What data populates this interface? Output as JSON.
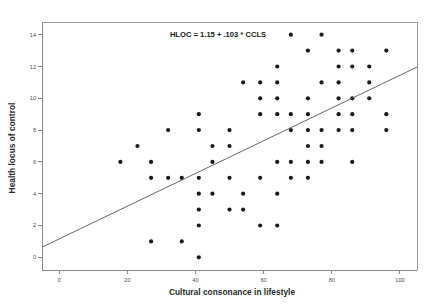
{
  "chart_data": {
    "type": "scatter",
    "title": "",
    "annotation": "HLOC = 1.15 + .103 * CCLS",
    "xlabel": "Cultural consonance in lifestyle",
    "ylabel": "Health locus of control",
    "xlim": [
      -5,
      105
    ],
    "ylim": [
      -0.8,
      14.8
    ],
    "xticks": [
      0,
      20,
      40,
      60,
      80,
      100
    ],
    "yticks": [
      0,
      2,
      4,
      6,
      8,
      10,
      12,
      14
    ],
    "grid": false,
    "legend": "none",
    "point_color": "#1a1a1a",
    "line_color": "#555555",
    "fit": {
      "intercept": 1.15,
      "slope": 0.103,
      "x_start": -5,
      "x_end": 105
    },
    "points": [
      [
        18,
        6
      ],
      [
        23,
        7
      ],
      [
        27,
        6
      ],
      [
        27,
        5
      ],
      [
        27,
        1
      ],
      [
        32,
        8
      ],
      [
        32,
        5
      ],
      [
        36,
        5
      ],
      [
        36,
        1
      ],
      [
        41,
        9
      ],
      [
        41,
        8
      ],
      [
        41,
        5
      ],
      [
        41,
        4
      ],
      [
        41,
        3
      ],
      [
        41,
        2
      ],
      [
        41,
        0
      ],
      [
        45,
        7
      ],
      [
        45,
        6
      ],
      [
        45,
        4
      ],
      [
        50,
        8
      ],
      [
        50,
        7
      ],
      [
        50,
        5
      ],
      [
        50,
        3
      ],
      [
        54,
        11
      ],
      [
        54,
        4
      ],
      [
        54,
        3
      ],
      [
        59,
        11
      ],
      [
        59,
        10
      ],
      [
        59,
        9
      ],
      [
        59,
        5
      ],
      [
        59,
        2
      ],
      [
        64,
        11
      ],
      [
        64,
        10
      ],
      [
        64,
        9
      ],
      [
        64,
        6
      ],
      [
        64,
        4
      ],
      [
        64,
        2
      ],
      [
        64,
        12
      ],
      [
        68,
        14
      ],
      [
        68,
        9
      ],
      [
        68,
        8
      ],
      [
        68,
        6
      ],
      [
        68,
        5
      ],
      [
        73,
        13
      ],
      [
        73,
        10
      ],
      [
        73,
        9
      ],
      [
        73,
        8
      ],
      [
        73,
        7
      ],
      [
        73,
        6
      ],
      [
        73,
        5
      ],
      [
        77,
        14
      ],
      [
        77,
        11
      ],
      [
        77,
        8
      ],
      [
        77,
        7
      ],
      [
        77,
        6
      ],
      [
        82,
        13
      ],
      [
        82,
        12
      ],
      [
        82,
        11
      ],
      [
        82,
        10
      ],
      [
        82,
        9
      ],
      [
        82,
        8
      ],
      [
        86,
        13
      ],
      [
        86,
        12
      ],
      [
        86,
        10
      ],
      [
        86,
        9
      ],
      [
        86,
        8
      ],
      [
        86,
        6
      ],
      [
        91,
        12
      ],
      [
        91,
        11
      ],
      [
        91,
        10
      ],
      [
        96,
        13
      ],
      [
        96,
        9
      ],
      [
        96,
        8
      ]
    ]
  },
  "axes": {
    "x_title": "Cultural consonance in lifestyle",
    "y_title": "Health locus of control",
    "x_tick_labels": [
      "0",
      "20",
      "40",
      "60",
      "80",
      "100"
    ],
    "y_tick_labels": [
      "0",
      "2",
      "4",
      "6",
      "8",
      "10",
      "12",
      "14"
    ]
  },
  "annotation": {
    "equation": "HLOC = 1.15 + .103 * CCLS"
  }
}
